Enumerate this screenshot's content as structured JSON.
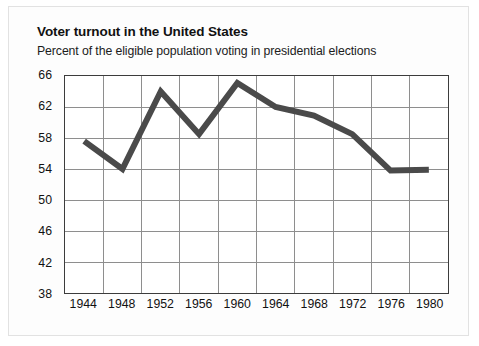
{
  "header": {
    "title": "Voter turnout in the United States",
    "subtitle": "Percent of the eligible population voting in presidential elections"
  },
  "style": {
    "line_color": "#4a4a4a",
    "grid_color": "#8d8d8d",
    "axis_color": "#3c3c3c",
    "plot_background": "#ffffff",
    "card_background": "#fdfdfd",
    "text_color": "#111111"
  },
  "chart_data": {
    "type": "line",
    "title": "Voter turnout in the United States",
    "subtitle": "Percent of the eligible population voting in presidential elections",
    "xlabel": "",
    "ylabel": "",
    "categories": [
      "1944",
      "1948",
      "1952",
      "1956",
      "1960",
      "1964",
      "1968",
      "1972",
      "1976",
      "1980"
    ],
    "x": [
      1944,
      1948,
      1952,
      1956,
      1960,
      1964,
      1968,
      1972,
      1976,
      1980
    ],
    "values": [
      57.6,
      54.0,
      64.0,
      58.5,
      65.1,
      62.0,
      60.9,
      58.5,
      53.8,
      53.9
    ],
    "series": [
      {
        "name": "Voter turnout",
        "values": [
          57.6,
          54.0,
          64.0,
          58.5,
          65.1,
          62.0,
          60.9,
          58.5,
          53.8,
          53.9
        ]
      }
    ],
    "ylim": [
      38,
      66
    ],
    "yticks": [
      38,
      42,
      46,
      50,
      54,
      58,
      62,
      66
    ],
    "ytick_labels": [
      "38",
      "42",
      "46",
      "50",
      "54",
      "58",
      "62",
      "66"
    ],
    "xtick_labels": [
      "1944",
      "1948",
      "1952",
      "1956",
      "1960",
      "1964",
      "1968",
      "1972",
      "1976",
      "1980"
    ],
    "grid": true,
    "grid_axis": "both",
    "legend": false,
    "legend_position": "none",
    "line_width_px": 6
  }
}
